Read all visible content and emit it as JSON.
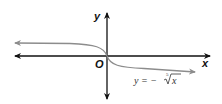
{
  "diagram": {
    "type": "function-graph",
    "axes": {
      "x_label": "x",
      "y_label": "y",
      "origin_label": "O"
    },
    "curve": {
      "equation_prefix": "y = −",
      "root_index": "5",
      "radicand": "x",
      "equation_full": "y = −⁵√x",
      "color": "#8c8c8c"
    },
    "colors": {
      "axis": "#111111",
      "curve": "#8c8c8c",
      "background": "#ffffff"
    }
  }
}
